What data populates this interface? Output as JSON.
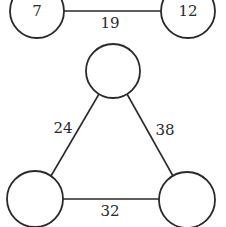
{
  "diagram": {
    "type": "graph",
    "colors": {
      "background": "#ffffff",
      "stroke": "#2a2a2a",
      "text": "#2a2a2a"
    },
    "graphs": [
      {
        "name": "pair-graph",
        "nodes": [
          {
            "id": "a",
            "label": "7",
            "cx": 37,
            "cy": 11,
            "r": 27
          },
          {
            "id": "b",
            "label": "12",
            "cx": 188,
            "cy": 11,
            "r": 27
          }
        ],
        "edges": [
          {
            "from": "a",
            "to": "b",
            "label": "19",
            "lx": 110,
            "ly": 23
          }
        ]
      },
      {
        "name": "triangle-graph",
        "nodes": [
          {
            "id": "top",
            "label": "",
            "cx": 113,
            "cy": 71,
            "r": 27
          },
          {
            "id": "left",
            "label": "",
            "cx": 35,
            "cy": 199,
            "r": 28
          },
          {
            "id": "right",
            "label": "",
            "cx": 187,
            "cy": 200,
            "r": 28
          }
        ],
        "edges": [
          {
            "from": "top",
            "to": "left",
            "label": "24",
            "lx": 63,
            "ly": 128
          },
          {
            "from": "top",
            "to": "right",
            "label": "38",
            "lx": 165,
            "ly": 130
          },
          {
            "from": "left",
            "to": "right",
            "label": "32",
            "lx": 110,
            "ly": 211
          }
        ]
      }
    ]
  }
}
